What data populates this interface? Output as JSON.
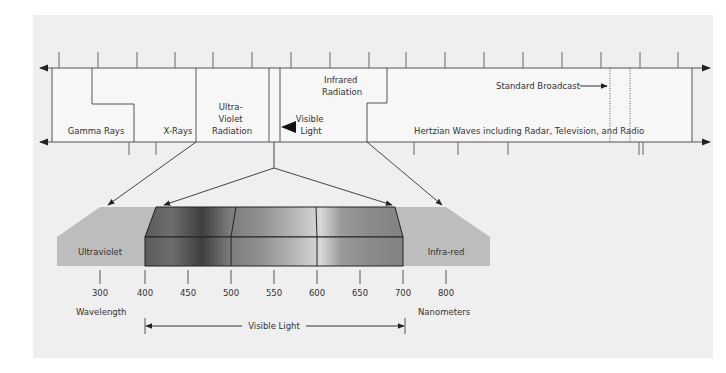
{
  "colors": {
    "panel": "#efefef",
    "box_fill": "#f7f7f7",
    "line": "#555555",
    "band": "#bdbdbd",
    "text": "#333333"
  },
  "spectrum_chart": {
    "regions": [
      {
        "label": "Gamma Rays"
      },
      {
        "label": "X-Rays"
      },
      {
        "label_lines": [
          "Ultra-",
          "Violet",
          "Radiation"
        ]
      },
      {
        "label_lines": [
          "Visible",
          "Light"
        ]
      },
      {
        "label_lines": [
          "Infrared",
          "Radiation"
        ]
      },
      {
        "label": "Standard Broadcast"
      },
      {
        "label": "Hertzian Waves including Radar, Television, and Radio"
      }
    ]
  },
  "visible_detail": {
    "left_band_label": "Ultraviolet",
    "right_band_label": "Infra-red",
    "ticks": [
      "300",
      "400",
      "450",
      "500",
      "550",
      "600",
      "650",
      "700",
      "800"
    ],
    "axis_left_label": "Wavelength",
    "axis_right_label": "Nanometers",
    "range_label": "Visible Light"
  }
}
